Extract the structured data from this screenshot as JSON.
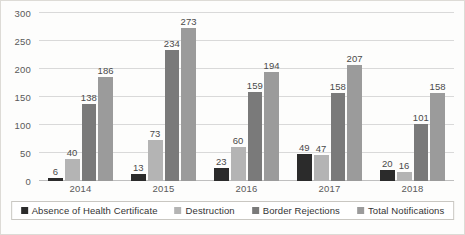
{
  "chart_data": {
    "type": "bar",
    "title": "",
    "subtitle": "",
    "xlabel": "",
    "ylabel": "",
    "categories": [
      "2014",
      "2015",
      "2016",
      "2017",
      "2018"
    ],
    "series": [
      {
        "name": "Absence of Health Certificate",
        "color": "#2b2b2b",
        "values": [
          6,
          13,
          23,
          49,
          20
        ]
      },
      {
        "name": "Destruction",
        "color": "#b4b4b4",
        "values": [
          40,
          73,
          60,
          47,
          16
        ]
      },
      {
        "name": "Border Rejections",
        "color": "#7a7a7a",
        "values": [
          138,
          234,
          159,
          158,
          101
        ]
      },
      {
        "name": "Total Notifications",
        "color": "#9b9b9b",
        "values": [
          186,
          273,
          194,
          207,
          158
        ]
      }
    ],
    "ylim": [
      0,
      300
    ],
    "yticks": [
      0,
      50,
      100,
      150,
      200,
      250,
      300
    ],
    "ytick_labels": [
      "0",
      "50",
      "100",
      "150",
      "200",
      "250",
      "300"
    ],
    "grid": true,
    "legend_position": "bottom",
    "data_labels": true
  },
  "legend": {
    "items": [
      {
        "label": "Absence of Health Certificate"
      },
      {
        "label": "Destruction"
      },
      {
        "label": "Border Rejections"
      },
      {
        "label": "Total Notifications"
      }
    ]
  }
}
